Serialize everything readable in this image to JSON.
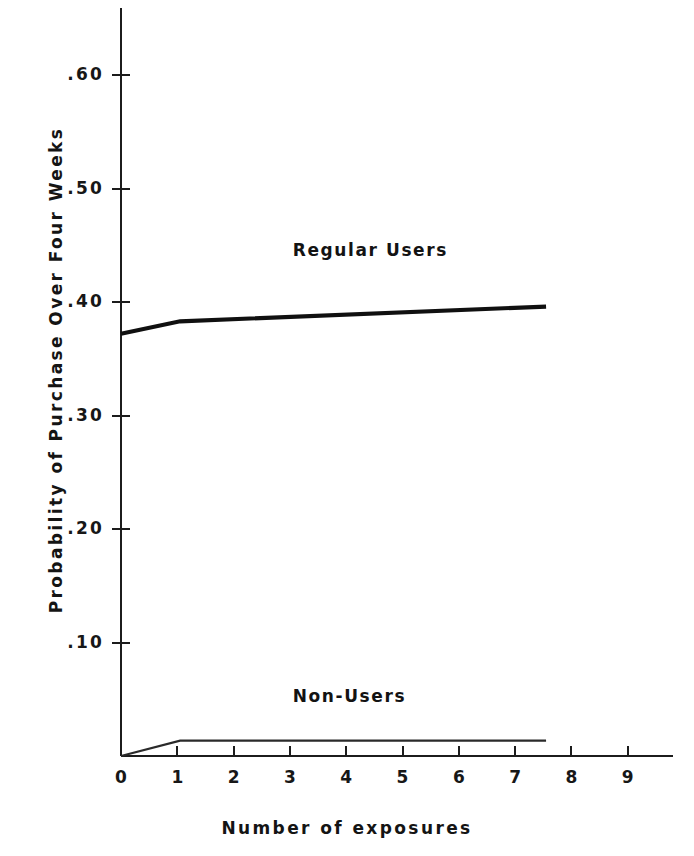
{
  "chart_data": {
    "type": "line",
    "title": "",
    "xlabel": "Number of exposures",
    "ylabel": "Probability of Purchase Over Four Weeks",
    "xlim": [
      0,
      9.8
    ],
    "ylim": [
      0,
      0.655
    ],
    "grid": false,
    "legend_position": "inline-annotation",
    "x_ticks": [
      "0",
      "1",
      "2",
      "3",
      "4",
      "5",
      "6",
      "7",
      "8",
      "9"
    ],
    "x_tick_values": [
      0,
      1,
      2,
      3,
      4,
      5,
      6,
      7,
      8,
      9
    ],
    "y_ticks": [
      ".10",
      ".20",
      ".30",
      ".40",
      ".50",
      ".60"
    ],
    "y_tick_values": [
      0.1,
      0.2,
      0.3,
      0.4,
      0.5,
      0.6
    ],
    "series": [
      {
        "name": "Regular Users",
        "label": "Regular Users",
        "label_x": 3.05,
        "label_y": 0.445,
        "color": "#101010",
        "line_width": 4.2,
        "x": [
          0,
          1.05,
          7.55
        ],
        "values": [
          0.372,
          0.383,
          0.396
        ]
      },
      {
        "name": "Non-Users",
        "label": "Non-Users",
        "label_x": 3.05,
        "label_y": 0.052,
        "color": "#2a2a2a",
        "line_width": 2.2,
        "x": [
          0,
          1.05,
          7.55
        ],
        "values": [
          0.0,
          0.0135,
          0.0135
        ]
      }
    ]
  },
  "axes": {
    "x_axis_label": "Number of exposures",
    "y_axis_label": "Probability of Purchase Over Four Weeks",
    "x_tick_labels": [
      "0",
      "1",
      "2",
      "3",
      "4",
      "5",
      "6",
      "7",
      "8",
      "9"
    ],
    "y_tick_labels": [
      ".60",
      ".50",
      ".40",
      ".30",
      ".20",
      ".10"
    ]
  },
  "annotations": [
    {
      "text": "Regular Users"
    },
    {
      "text": "Non-Users"
    }
  ]
}
